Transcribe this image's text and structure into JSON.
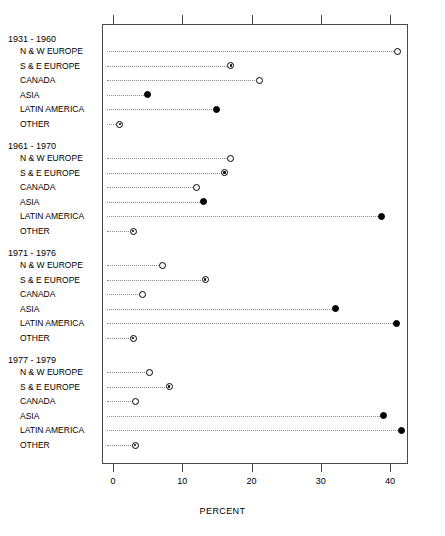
{
  "chart_data": {
    "type": "scatter",
    "title": "",
    "xlabel": "PERCENT",
    "ylabel": "",
    "xlim": [
      -1.3,
      42.9
    ],
    "xticks": [
      0,
      10,
      20,
      30,
      40
    ],
    "xtick_labels": [
      "0",
      "10",
      "20",
      "30",
      "40"
    ],
    "grid": false,
    "legend": "none",
    "leader_lines": "dotted",
    "categories": [
      "N & W EUROPE",
      "S & E EUROPE",
      "CANADA",
      "ASIA",
      "LATIN AMERICA",
      "OTHER"
    ],
    "groups": [
      {
        "label": "1931 - 1960",
        "points": [
          {
            "category": "N & W EUROPE",
            "value": 41.1,
            "marker": "open"
          },
          {
            "category": "S & E EUROPE",
            "value": 17.0,
            "marker": "dotted-center"
          },
          {
            "category": "CANADA",
            "value": 21.1,
            "marker": "open"
          },
          {
            "category": "ASIA",
            "value": 5.0,
            "marker": "filled"
          },
          {
            "category": "LATIN AMERICA",
            "value": 14.9,
            "marker": "filled"
          },
          {
            "category": "OTHER",
            "value": 1.0,
            "marker": "dotted-center"
          }
        ]
      },
      {
        "label": "1961 - 1970",
        "points": [
          {
            "category": "N & W EUROPE",
            "value": 17.0,
            "marker": "open"
          },
          {
            "category": "S & E EUROPE",
            "value": 16.1,
            "marker": "dotted-center"
          },
          {
            "category": "CANADA",
            "value": 12.1,
            "marker": "open"
          },
          {
            "category": "ASIA",
            "value": 13.1,
            "marker": "filled"
          },
          {
            "category": "LATIN AMERICA",
            "value": 38.8,
            "marker": "filled"
          },
          {
            "category": "OTHER",
            "value": 2.9,
            "marker": "dotted-center"
          }
        ]
      },
      {
        "label": "1971 - 1976",
        "points": [
          {
            "category": "N & W EUROPE",
            "value": 7.2,
            "marker": "open"
          },
          {
            "category": "S & E EUROPE",
            "value": 13.3,
            "marker": "dotted-center"
          },
          {
            "category": "CANADA",
            "value": 4.2,
            "marker": "open"
          },
          {
            "category": "ASIA",
            "value": 32.2,
            "marker": "filled"
          },
          {
            "category": "LATIN AMERICA",
            "value": 41.0,
            "marker": "filled"
          },
          {
            "category": "OTHER",
            "value": 2.9,
            "marker": "dotted-center"
          }
        ]
      },
      {
        "label": "1977 - 1979",
        "points": [
          {
            "category": "N & W EUROPE",
            "value": 5.2,
            "marker": "open"
          },
          {
            "category": "S & E EUROPE",
            "value": 8.1,
            "marker": "dotted-center"
          },
          {
            "category": "CANADA",
            "value": 3.2,
            "marker": "open"
          },
          {
            "category": "ASIA",
            "value": 39.1,
            "marker": "filled"
          },
          {
            "category": "LATIN AMERICA",
            "value": 41.7,
            "marker": "filled"
          },
          {
            "category": "OTHER",
            "value": 3.2,
            "marker": "dotted-center"
          }
        ]
      }
    ]
  },
  "colors": {
    "axis": "#4a4a4a",
    "marker": "#000000",
    "leader": "#8a8a8a",
    "background": "#ffffff"
  }
}
